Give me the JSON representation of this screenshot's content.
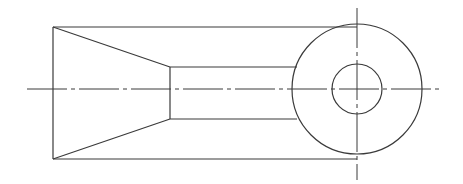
{
  "drawing": {
    "type": "orthographic-part-view",
    "line_color": "#3a3a3a",
    "background": "#ffffff",
    "outer_body": {
      "left": 53,
      "top": 27,
      "right": 357,
      "bottom": 159
    },
    "taper": {
      "apex_left_x": 53,
      "top_y": 27,
      "bottom_y": 159,
      "end_x": 170,
      "end_top_y": 67,
      "end_bottom_y": 119
    },
    "neck": {
      "left": 170,
      "top": 67,
      "right": 297,
      "bottom": 119
    },
    "boss_circle": {
      "cx": 357,
      "cy": 89,
      "r": 65
    },
    "hole_circle": {
      "cx": 357,
      "cy": 89,
      "r": 25
    },
    "horizontal_centerline": {
      "x1": 27,
      "x2": 440,
      "y": 89
    },
    "vertical_centerline": {
      "x": 357,
      "y1": 8,
      "y2": 180
    }
  }
}
